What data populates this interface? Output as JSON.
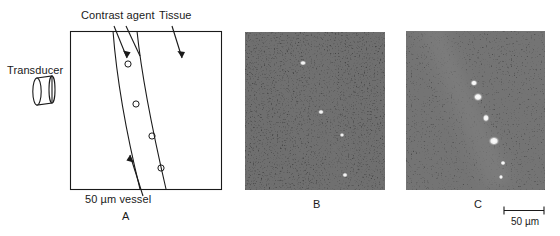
{
  "figure": {
    "type": "scientific-figure"
  },
  "panel_a": {
    "letter": "A",
    "labels": {
      "transducer": "Transducer",
      "contrast_agent": "Contrast agent",
      "tissue": "Tissue",
      "vessel": "50 µm vessel"
    },
    "microbubble_count": 4,
    "stroke_color": "#1a1a1a"
  },
  "panel_b": {
    "letter": "B",
    "bright_spot_count": 4,
    "background_tone": "dark speckle"
  },
  "panel_c": {
    "letter": "C",
    "bright_spot_count": 6,
    "background_tone": "dark speckle with bright diagonal vessel band"
  },
  "scale_bar": {
    "label": "50 µm"
  }
}
